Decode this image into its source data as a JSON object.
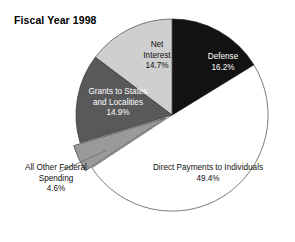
{
  "chart_data": {
    "type": "pie",
    "title": "Fiscal Year 1998",
    "xlabel": "",
    "ylabel": "",
    "legend": "none",
    "grid": false,
    "start_angle_deg": 0,
    "direction": "clockwise",
    "categories": [
      "Defense",
      "Direct Payments to Individuals",
      "All Other Federal Spending",
      "Grants to States and Localities",
      "Net Interest"
    ],
    "values": [
      16.2,
      49.4,
      4.6,
      14.9,
      14.7
    ],
    "value_suffix": "%",
    "slices": [
      {
        "label": "Defense",
        "value": 16.2,
        "value_text": "16.2%",
        "color": "#121212",
        "text_color": "#ffffff",
        "exploded": false
      },
      {
        "label": "Direct Payments to Individuals",
        "value": 49.4,
        "value_text": "49.4%",
        "color": "#ffffff",
        "text_color": "#111111",
        "exploded": false
      },
      {
        "label": "All Other Federal Spending",
        "value": 4.6,
        "value_text": "4.6%",
        "color": "#9a9a9a",
        "text_color": "#111111",
        "exploded": true
      },
      {
        "label": "Grants to States and Localities",
        "value": 14.9,
        "value_text": "14.9%",
        "color": "#595959",
        "text_color": "#ffffff",
        "exploded": false
      },
      {
        "label": "Net Interest",
        "value": 14.7,
        "value_text": "14.7%",
        "color": "#cfcfcf",
        "text_color": "#111111",
        "exploded": false
      }
    ]
  },
  "labels": {
    "defense": {
      "name": "Defense",
      "value": "16.2%"
    },
    "direct_payments": {
      "name": "Direct Payments to Individuals",
      "value": "49.4%"
    },
    "other_federal": {
      "name_line1": "All Other Federal",
      "name_line2": "Spending",
      "value": "4.6%"
    },
    "grants": {
      "name_line1": "Grants to States",
      "name_line2": "and Localities",
      "value": "14.9%"
    },
    "net_interest": {
      "name_line1": "Net",
      "name_line2": "Interest",
      "value": "14.7%"
    }
  },
  "colors": {
    "background": "#ffffff",
    "outline": "#555555",
    "title": "#000000",
    "defense": "#121212",
    "direct_payments": "#ffffff",
    "other_federal": "#9a9a9a",
    "grants": "#595959",
    "net_interest": "#cfcfcf"
  }
}
